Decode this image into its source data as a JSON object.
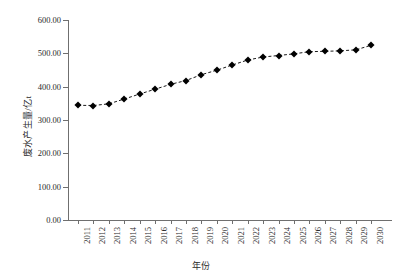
{
  "chart_data": {
    "type": "line",
    "title": "",
    "xlabel": "年份",
    "ylabel": "废水产生量/亿t",
    "categories": [
      "2011",
      "2012",
      "2013",
      "2014",
      "2015",
      "2016",
      "2017",
      "2018",
      "2019",
      "2020",
      "2021",
      "2022",
      "2023",
      "2024",
      "2025",
      "2026",
      "2027",
      "2028",
      "2029",
      "2030"
    ],
    "x": [
      2011,
      2012,
      2013,
      2014,
      2015,
      2016,
      2017,
      2018,
      2019,
      2020,
      2021,
      2022,
      2023,
      2024,
      2025,
      2026,
      2027,
      2028,
      2029,
      2030
    ],
    "values": [
      344.0,
      343.5,
      348.5,
      363.0,
      378.0,
      392.5,
      407.0,
      418.5,
      436.0,
      449.5,
      465.0,
      480.0,
      489.0,
      493.5,
      498.5,
      505.0,
      506.0,
      507.5,
      510.5,
      524.0
    ],
    "series": [
      {
        "name": "废水产生量",
        "values": [
          344.0,
          343.5,
          348.5,
          363.0,
          378.0,
          392.5,
          407.0,
          418.5,
          436.0,
          449.5,
          465.0,
          480.0,
          489.0,
          493.5,
          498.5,
          505.0,
          506.0,
          507.5,
          510.5,
          524.0
        ]
      }
    ],
    "ylim": [
      0,
      600
    ],
    "yticks": [
      0,
      100,
      200,
      300,
      400,
      500,
      600
    ],
    "ytick_labels": [
      "0.00",
      "100.00",
      "200.00",
      "300.00",
      "400.00",
      "500.00",
      "600.00"
    ],
    "grid": false,
    "legend": false,
    "legend_position": "none",
    "line_style": "dashed",
    "marker": "diamond",
    "series_color": "#000000",
    "axis_color": "#6f6f6f",
    "background_color": "#ffffff"
  }
}
